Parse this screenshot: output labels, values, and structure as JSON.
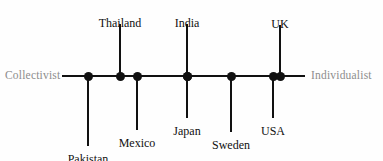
{
  "figure": {
    "type": "annotated-number-line",
    "left_pole": "Collectivist",
    "right_pole": "Individualist"
  },
  "chart_data": {
    "type": "scatter",
    "title": "",
    "subtitle": "",
    "xlabel": "",
    "ylabel": "",
    "orientation": "horizontal",
    "grid": false,
    "legend": "none",
    "axis_endpoints": {
      "left_label": "Collectivist",
      "right_label": "Individualist"
    },
    "axis_pixel_range": [
      62,
      305
    ],
    "axis_pixel_y": 76,
    "categories": [
      "Pakistan",
      "Thailand",
      "Mexico",
      "India",
      "Japan",
      "Sweden",
      "USA",
      "UK"
    ],
    "points": [
      {
        "label": "Pakistan",
        "x": 88,
        "side": "below",
        "label_y": 152,
        "stem_from": 76,
        "stem_to": 146
      },
      {
        "label": "Thailand",
        "x": 120,
        "side": "above",
        "label_y": 16,
        "stem_from": 24,
        "stem_to": 76
      },
      {
        "label": "Mexico",
        "x": 137,
        "side": "below",
        "label_y": 136,
        "stem_from": 76,
        "stem_to": 130
      },
      {
        "label": "India",
        "x": 187,
        "side": "above",
        "label_y": 16,
        "stem_from": 24,
        "stem_to": 76
      },
      {
        "label": "Japan",
        "x": 187,
        "side": "below",
        "label_y": 124,
        "stem_from": 76,
        "stem_to": 118
      },
      {
        "label": "Sweden",
        "x": 231,
        "side": "below",
        "label_y": 138,
        "stem_from": 76,
        "stem_to": 132
      },
      {
        "label": "USA",
        "x": 273,
        "side": "below",
        "label_y": 124,
        "stem_from": 76,
        "stem_to": 118
      },
      {
        "label": "UK",
        "x": 280,
        "side": "above",
        "label_y": 17,
        "stem_from": 25,
        "stem_to": 76
      }
    ],
    "values_note": "Position along the Collectivist (left) to Individualist (right) continuum",
    "xlim": [
      "Collectivist",
      "Individualist"
    ]
  },
  "colors": {
    "marker": "#111111",
    "line": "#111111",
    "label_text": "#101010",
    "pole_text": "#8d8d8d",
    "background": "#fefefe"
  }
}
